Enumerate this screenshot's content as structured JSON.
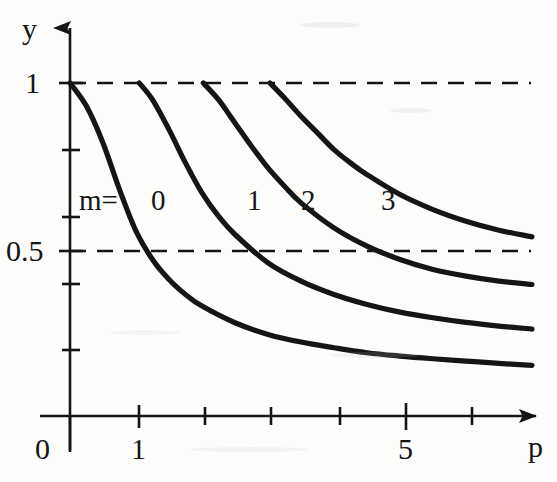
{
  "figure": {
    "background_color": "#fdfdfc",
    "ink_color": "#151515",
    "width": 557,
    "height": 482
  },
  "axes": {
    "x_axis_label": "p",
    "y_axis_label": "y",
    "origin_label": "0",
    "x_tick_labels": [
      "1",
      "5"
    ],
    "y_tick_labels": [
      "1",
      "0.5"
    ]
  },
  "annotations": {
    "m_prefix": "m=",
    "curve_labels": [
      "0",
      "1",
      "2",
      "3"
    ]
  },
  "chart_data": {
    "type": "line",
    "title": "",
    "xlabel": "p",
    "ylabel": "y",
    "xlim": [
      0,
      7.4
    ],
    "ylim": [
      0,
      1.12
    ],
    "grid": false,
    "legend": "inline curve labels",
    "x_ticks": [
      0,
      1,
      2,
      3,
      4,
      5,
      6,
      7
    ],
    "x_tick_labels_shown": {
      "0": "0",
      "1": "1",
      "5": "5"
    },
    "y_ticks": [
      0.1,
      0.2,
      0.3,
      0.4,
      0.5,
      0.6,
      0.7,
      0.8,
      0.9,
      1.0
    ],
    "y_tick_labels_shown": {
      "1": "1",
      "0.5": "0.5"
    },
    "reference_lines": [
      {
        "axis": "y",
        "value": 1.0,
        "style": "dashed"
      },
      {
        "axis": "y",
        "value": 0.5,
        "style": "dashed"
      }
    ],
    "series": [
      {
        "name": "m=0",
        "label": "0",
        "x": [
          0.0,
          0.25,
          0.5,
          0.75,
          1.0,
          1.25,
          1.5,
          1.75,
          2.0,
          2.5,
          3.0,
          3.5,
          4.0,
          4.5,
          5.0,
          5.5,
          6.0,
          6.5,
          7.0
        ],
        "y": [
          1.0,
          0.93,
          0.82,
          0.68,
          0.555,
          0.47,
          0.41,
          0.365,
          0.33,
          0.28,
          0.245,
          0.222,
          0.205,
          0.19,
          0.18,
          0.172,
          0.165,
          0.158,
          0.152
        ]
      },
      {
        "name": "m=1",
        "label": "1",
        "x": [
          1.05,
          1.25,
          1.5,
          1.75,
          2.0,
          2.25,
          2.5,
          3.0,
          3.5,
          4.0,
          4.5,
          5.0,
          5.5,
          6.0,
          6.5,
          7.0
        ],
        "y": [
          1.0,
          0.95,
          0.86,
          0.76,
          0.67,
          0.6,
          0.545,
          0.46,
          0.405,
          0.365,
          0.335,
          0.312,
          0.295,
          0.281,
          0.27,
          0.261
        ]
      },
      {
        "name": "m=2",
        "label": "2",
        "x": [
          2.02,
          2.25,
          2.5,
          2.75,
          3.0,
          3.25,
          3.5,
          4.0,
          4.5,
          5.0,
          5.5,
          6.0,
          6.5,
          7.0
        ],
        "y": [
          1.0,
          0.95,
          0.88,
          0.81,
          0.745,
          0.69,
          0.64,
          0.565,
          0.51,
          0.47,
          0.44,
          0.42,
          0.405,
          0.395
        ]
      },
      {
        "name": "m=3",
        "label": "3",
        "x": [
          3.03,
          3.25,
          3.5,
          3.75,
          4.0,
          4.25,
          4.5,
          5.0,
          5.5,
          6.0,
          6.5,
          7.0
        ],
        "y": [
          1.0,
          0.955,
          0.9,
          0.85,
          0.8,
          0.76,
          0.725,
          0.665,
          0.62,
          0.585,
          0.558,
          0.538
        ]
      }
    ]
  }
}
